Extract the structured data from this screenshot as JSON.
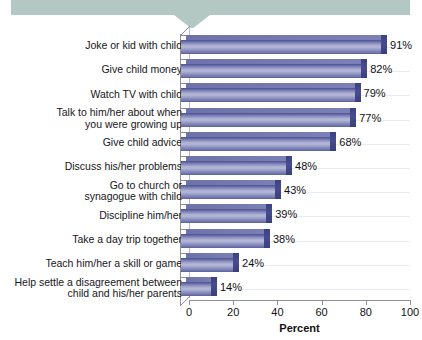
{
  "chart_data": {
    "type": "bar",
    "orientation": "horizontal",
    "title": "",
    "xlabel": "Percent",
    "ylabel": "",
    "xlim": [
      0,
      100
    ],
    "xticks": [
      0,
      20,
      40,
      60,
      80,
      100
    ],
    "grid": true,
    "legend": "none",
    "value_suffix": "%",
    "categories": [
      "Joke or kid with child",
      "Give child money",
      "Watch TV with child",
      "Talk to him/her about when\nyou were growing up",
      "Give child advice",
      "Discuss his/her problems",
      "Go to church or\nsynagogue with child",
      "Discipline him/her",
      "Take a day trip together",
      "Teach him/her a skill or game",
      "Help settle a disagreement between\nchild and his/her parents"
    ],
    "values": [
      91,
      82,
      79,
      77,
      68,
      48,
      43,
      39,
      38,
      24,
      14
    ],
    "value_labels": [
      "91%",
      "82%",
      "79%",
      "77%",
      "68%",
      "48%",
      "43%",
      "39%",
      "38%",
      "24%",
      "14%"
    ],
    "colors": {
      "bar_light": "#b6b9d8",
      "bar_mid": "#8a8fbe",
      "bar_dark": "#4b4f91",
      "bar_cap": "#3c4184",
      "banner": "#b3c8c3",
      "axis": "#8d9096",
      "grid": "#e9edf3",
      "text": "#111114",
      "background": "#ffffff"
    }
  },
  "banner": {
    "label": ""
  },
  "axis": {
    "x_title": "Percent",
    "tick_labels": [
      "0",
      "20",
      "40",
      "60",
      "80",
      "100"
    ]
  }
}
